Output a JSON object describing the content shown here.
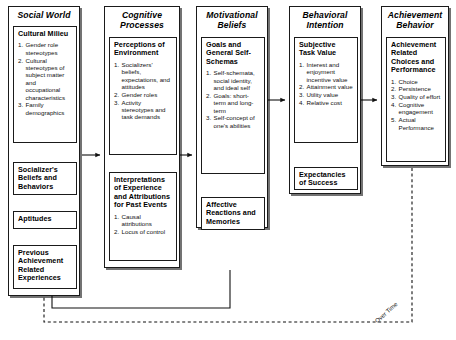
{
  "diagram": {
    "feedback_label": "Over Time",
    "columns": [
      {
        "id": "social-world",
        "header": "Social World",
        "boxes": [
          {
            "id": "cultural-milieu",
            "title": "Cultural Milieu",
            "items": [
              "Gender role stereotypes",
              "Cultural stereotypes of subject matter and occupational characteristics",
              "Family demographics"
            ]
          },
          {
            "id": "socializers-beliefs",
            "title": "Socializer's Beliefs and Behaviors",
            "items": []
          },
          {
            "id": "aptitudes",
            "title": "Aptitudes",
            "items": []
          },
          {
            "id": "previous-achievement",
            "title": "Previous Achievement Related Experiences",
            "items": []
          }
        ]
      },
      {
        "id": "cognitive-processes",
        "header": "Cognitive Processes",
        "boxes": [
          {
            "id": "perceptions-of-environment",
            "title": "Perceptions of Environment",
            "items": [
              "Socializers' beliefs, expectations, and attitudes",
              "Gender roles",
              "Activity stereotypes and task demands"
            ]
          },
          {
            "id": "interpretations-of-experience",
            "title": "Interpretations of Experience and Attributions for Past Events",
            "items": [
              "Causal attributions",
              "Locus of control"
            ]
          }
        ]
      },
      {
        "id": "motivational-beliefs",
        "header": "Motivational Beliefs",
        "boxes": [
          {
            "id": "goals-and-self-schemas",
            "title": "Goals and General Self-Schemas",
            "items": [
              "Self-schemata, social identity, and ideal self",
              "Goals: short-term and long-term",
              "Self-concept of one's abilities"
            ]
          },
          {
            "id": "affective-reactions",
            "title": "Affective Reactions and Memories",
            "items": []
          }
        ]
      },
      {
        "id": "behavioral-intention",
        "header": "Behavioral Intention",
        "boxes": [
          {
            "id": "subjective-task-value",
            "title": "Subjective Task Value",
            "items": [
              "Interest and enjoyment incentive value",
              "Attainment value",
              "Utility value",
              "Relative cost"
            ]
          },
          {
            "id": "expectancies-of-success",
            "title": "Expectancies of Success",
            "items": []
          }
        ]
      },
      {
        "id": "achievement-behavior",
        "header": "Achievement Behavior",
        "boxes": [
          {
            "id": "achievement-choices",
            "title": "Achievement Related Choices and Performance",
            "items": [
              "Choice",
              "Persistence",
              "Quality of effort",
              "Cognitive engagement",
              "Actual Performance"
            ]
          }
        ]
      }
    ]
  }
}
